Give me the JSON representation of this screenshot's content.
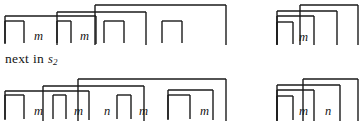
{
  "document": {
    "kind": "scanned-figure",
    "background_color": "#ffffff",
    "ink_color": "#1a1a1a",
    "width": 362,
    "height": 123
  },
  "caption": {
    "text_before": "next",
    "text_middle": "in",
    "symbol": "s",
    "subscript": "2",
    "full_text": "next in s2"
  },
  "rows": [
    {
      "name": "top-row",
      "clusters": [
        {
          "name": "top-left-cluster",
          "labels": [
            {
              "text": "m",
              "x": 34,
              "y": 30
            },
            {
              "text": "m",
              "x": 80,
              "y": 30
            }
          ],
          "brackets": [
            {
              "name": "bracket-1",
              "x1": 5,
              "x2": 24,
              "top": 21,
              "bottom": 43
            },
            {
              "name": "bracket-2",
              "x1": 5,
              "x2": 96,
              "top": 16,
              "bottom": 44
            },
            {
              "name": "bracket-3",
              "x1": 57,
              "x2": 71,
              "top": 21,
              "bottom": 43
            },
            {
              "name": "bracket-4",
              "x1": 57,
              "x2": 146,
              "top": 12,
              "bottom": 45
            },
            {
              "name": "bracket-5",
              "x1": 104,
              "x2": 124,
              "top": 21,
              "bottom": 43
            },
            {
              "name": "bracket-6",
              "x1": 95,
              "x2": 226,
              "top": 5,
              "bottom": 45
            },
            {
              "name": "bracket-7",
              "x1": 162,
              "x2": 182,
              "top": 21,
              "bottom": 43
            }
          ]
        },
        {
          "name": "top-right-cluster",
          "labels": [
            {
              "text": "m",
              "x": 299,
              "y": 31
            }
          ],
          "brackets": [
            {
              "name": "bracket-1",
              "x1": 277,
              "x2": 293,
              "top": 22,
              "bottom": 44
            },
            {
              "name": "bracket-2",
              "x1": 277,
              "x2": 314,
              "top": 16,
              "bottom": 45
            },
            {
              "name": "bracket-3",
              "x1": 277,
              "x2": 337,
              "top": 11,
              "bottom": 45
            },
            {
              "name": "bracket-4",
              "x1": 300,
              "x2": 358,
              "top": 5,
              "bottom": 45
            }
          ]
        }
      ]
    },
    {
      "name": "bottom-row",
      "clusters": [
        {
          "name": "bottom-left-cluster",
          "labels": [
            {
              "text": "m",
              "x": 34,
              "y": 105
            },
            {
              "text": "m",
              "x": 74,
              "y": 105
            },
            {
              "text": "n",
              "x": 104,
              "y": 105
            },
            {
              "text": "m",
              "x": 139,
              "y": 105
            },
            {
              "text": "m",
              "x": 200,
              "y": 105
            }
          ],
          "brackets": [
            {
              "name": "bracket-1",
              "x1": 5,
              "x2": 24,
              "top": 95,
              "bottom": 119
            },
            {
              "name": "bracket-2",
              "x1": 5,
              "x2": 89,
              "top": 91,
              "bottom": 120
            },
            {
              "name": "bracket-3",
              "x1": 53,
              "x2": 66,
              "top": 95,
              "bottom": 119
            },
            {
              "name": "bracket-4",
              "x1": 43,
              "x2": 144,
              "top": 86,
              "bottom": 121
            },
            {
              "name": "bracket-5",
              "x1": 117,
              "x2": 131,
              "top": 95,
              "bottom": 119
            },
            {
              "name": "bracket-6",
              "x1": 78,
              "x2": 226,
              "top": 79,
              "bottom": 121
            },
            {
              "name": "bracket-7",
              "x1": 168,
              "x2": 190,
              "top": 95,
              "bottom": 119
            },
            {
              "name": "bracket-8",
              "x1": 168,
              "x2": 213,
              "top": 90,
              "bottom": 120
            }
          ]
        },
        {
          "name": "bottom-right-cluster",
          "labels": [
            {
              "text": "m",
              "x": 299,
              "y": 105
            },
            {
              "text": "n",
              "x": 325,
              "y": 105
            }
          ],
          "brackets": [
            {
              "name": "bracket-1",
              "x1": 277,
              "x2": 293,
              "top": 96,
              "bottom": 120
            },
            {
              "name": "bracket-2",
              "x1": 277,
              "x2": 314,
              "top": 90,
              "bottom": 121
            },
            {
              "name": "bracket-3",
              "x1": 277,
              "x2": 340,
              "top": 85,
              "bottom": 121
            },
            {
              "name": "bracket-4",
              "x1": 303,
              "x2": 358,
              "top": 79,
              "bottom": 121
            }
          ]
        }
      ]
    }
  ]
}
